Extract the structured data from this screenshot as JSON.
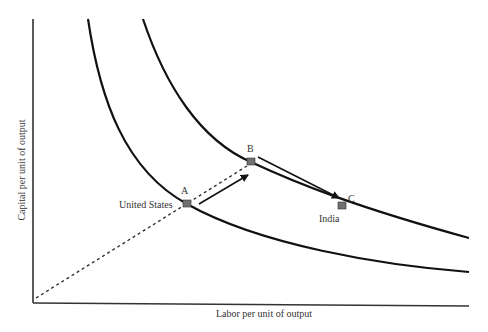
{
  "diagram": {
    "type": "isoquant",
    "x_axis_label": "Labor per unit of output",
    "y_axis_label": "Capital per unit of output",
    "points": [
      {
        "id": "A",
        "label": "A",
        "annotation": "United States"
      },
      {
        "id": "B",
        "label": "B",
        "annotation": ""
      },
      {
        "id": "C",
        "label": "C",
        "annotation": "India"
      }
    ],
    "curves": [
      {
        "name": "inner-isoquant"
      },
      {
        "name": "outer-isoquant"
      }
    ],
    "arrows": [
      {
        "from": "A",
        "to": "B"
      },
      {
        "from": "B",
        "to": "C"
      }
    ],
    "ray": {
      "from": "origin",
      "through": [
        "A",
        "B"
      ],
      "style": "dashed"
    },
    "colors": {
      "line": "#111111",
      "marker": "#707070"
    }
  }
}
